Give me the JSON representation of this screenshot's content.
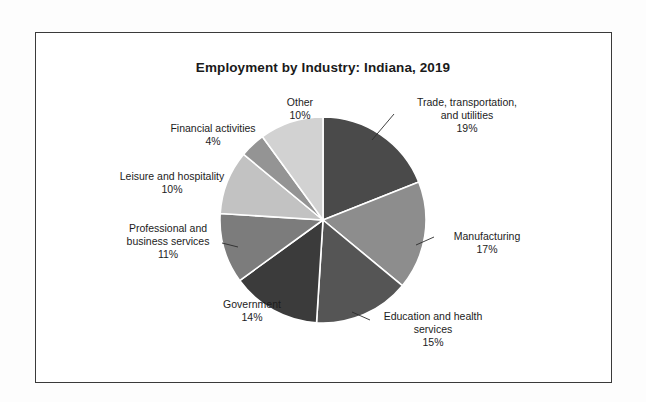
{
  "chart_data": {
    "type": "pie",
    "title": "Employment by Industry: Indiana, 2019",
    "xlabel": "",
    "ylabel": "",
    "legend_position": "none",
    "grid": false,
    "labels_show_percent": true,
    "start_angle_deg": 0,
    "direction": "clockwise",
    "categories": [
      "Trade, transportation, and utilities",
      "Manufacturing",
      "Education and health services",
      "Government",
      "Professional and business services",
      "Leisure and hospitality",
      "Financial activities",
      "Other"
    ],
    "values": [
      19,
      17,
      15,
      14,
      11,
      10,
      4,
      10
    ],
    "value_labels": [
      "19%",
      "17%",
      "15%",
      "14%",
      "11%",
      "10%",
      "4%",
      "10%"
    ],
    "colors": [
      "#4a4a4a",
      "#8d8d8d",
      "#555555",
      "#3b3b3b",
      "#7c7c7c",
      "#c2c2c2",
      "#949494",
      "#d2d2d2"
    ],
    "slices": [
      {
        "name": "Trade, transportation, and utilities",
        "value": 19,
        "label": "19%",
        "color": "#4a4a4a"
      },
      {
        "name": "Manufacturing",
        "value": 17,
        "label": "17%",
        "color": "#8d8d8d"
      },
      {
        "name": "Education and health services",
        "value": 15,
        "label": "15%",
        "color": "#555555"
      },
      {
        "name": "Government",
        "value": 14,
        "label": "14%",
        "color": "#3b3b3b"
      },
      {
        "name": "Professional and business services",
        "value": 11,
        "label": "11%",
        "color": "#7c7c7c"
      },
      {
        "name": "Leisure and hospitality",
        "value": 10,
        "label": "10%",
        "color": "#c2c2c2"
      },
      {
        "name": "Financial activities",
        "value": 4,
        "label": "4%",
        "color": "#949494"
      },
      {
        "name": "Other",
        "value": 10,
        "label": "10%",
        "color": "#d2d2d2"
      }
    ]
  },
  "labels": {
    "other": "Other\n10%",
    "trade": "Trade, transportation,\nand utilities\n19%",
    "manufacturing": "Manufacturing\n17%",
    "education": "Education and health\nservices\n15%",
    "government": "Government\n14%",
    "professional": "Professional and\nbusiness services\n11%",
    "leisure": "Leisure and hospitality\n10%",
    "financial": "Financial activities\n4%"
  }
}
